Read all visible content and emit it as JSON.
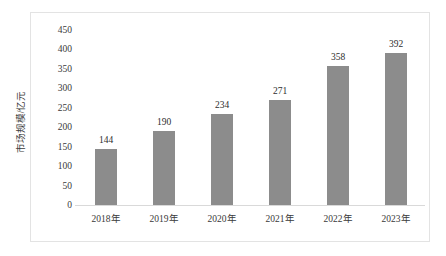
{
  "chart_data": {
    "type": "bar",
    "title": "",
    "subtitle": "",
    "xlabel": "",
    "ylabel": "市场规模/亿元",
    "categories": [
      "2018年",
      "2019年",
      "2020年",
      "2021年",
      "2022年",
      "2023年"
    ],
    "values": [
      144,
      190,
      234,
      271,
      358,
      392
    ],
    "data_labels": [
      "144",
      "190",
      "234",
      "271",
      "358",
      "392"
    ],
    "ylim": [
      0,
      450
    ],
    "ytick_step": 50,
    "ytick_labels": [
      "450",
      "400",
      "350",
      "300",
      "250",
      "200",
      "150",
      "100",
      "50",
      "0"
    ],
    "ytick_values": [
      450,
      400,
      350,
      300,
      250,
      200,
      150,
      100,
      50,
      0
    ],
    "grid": false,
    "legend": null,
    "legend_position": "none",
    "series": [
      {
        "name": "市场规模",
        "values": [
          144,
          190,
          234,
          271,
          358,
          392
        ]
      }
    ],
    "colors": {
      "bar": "#8c8c8c",
      "plot_background": "#ffffff",
      "border": "#e3e3e3",
      "axis_line": "#d9d9d9",
      "text": "#3a3a3a"
    }
  }
}
